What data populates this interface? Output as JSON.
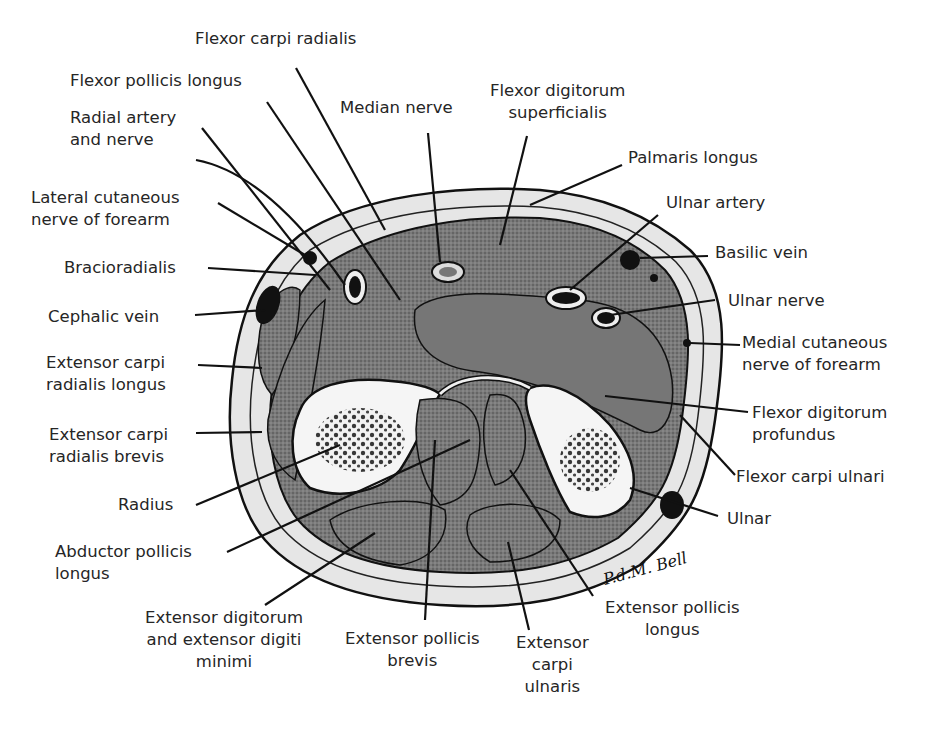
{
  "figure": {
    "signature": "P.d.M. Bell"
  },
  "labels": [
    {
      "id": "flexor-carpi-radialis",
      "text": "Flexor carpi radialis"
    },
    {
      "id": "flexor-pollicis-longus",
      "text": "Flexor pollicis longus"
    },
    {
      "id": "radial-artery-and-nerve",
      "text": "Radial artery\nand nerve"
    },
    {
      "id": "median-nerve",
      "text": "Median nerve"
    },
    {
      "id": "flexor-digitorum-superficialis",
      "text": "Flexor digitorum\nsuperficialis"
    },
    {
      "id": "palmaris-longus",
      "text": "Palmaris longus"
    },
    {
      "id": "ulnar-artery",
      "text": "Ulnar artery"
    },
    {
      "id": "basilic-vein",
      "text": "Basilic vein"
    },
    {
      "id": "ulnar-nerve",
      "text": "Ulnar nerve"
    },
    {
      "id": "medial-cutaneous-nerve",
      "text": "Medial cutaneous\nnerve of forearm"
    },
    {
      "id": "flexor-digitorum-profundus",
      "text": "Flexor digitorum\nprofundus"
    },
    {
      "id": "flexor-carpi-ulnari",
      "text": "Flexor carpi ulnari"
    },
    {
      "id": "ulnar",
      "text": "Ulnar"
    },
    {
      "id": "lateral-cutaneous-nerve",
      "text": "Lateral cutaneous\nnerve of forearm"
    },
    {
      "id": "bracioradialis",
      "text": "Bracioradialis"
    },
    {
      "id": "cephalic-vein",
      "text": "Cephalic vein"
    },
    {
      "id": "extensor-carpi-radialis-longus",
      "text": "Extensor carpi\nradialis longus"
    },
    {
      "id": "extensor-carpi-radialis-brevis",
      "text": "Extensor carpi\nradialis brevis"
    },
    {
      "id": "radius",
      "text": "Radius"
    },
    {
      "id": "abductor-pollicis-longus",
      "text": "Abductor pollicis\nlongus"
    },
    {
      "id": "extensor-digitorum",
      "text": "Extensor digitorum\nand extensor digiti\nminimi"
    },
    {
      "id": "extensor-pollicis-brevis",
      "text": "Extensor pollicis\nbrevis"
    },
    {
      "id": "extensor-carpi-ulnaris",
      "text": "Extensor\ncarpi\nulnaris"
    },
    {
      "id": "extensor-pollicis-longus",
      "text": "Extensor pollicis\nlongus"
    }
  ],
  "colors": {
    "background": "#ffffff",
    "ink": "#1a1a1a",
    "muscle": "#6e6e6e",
    "subcutaneous": "#e4e4e4",
    "bone_cortex": "#f4f4f4",
    "bone_marrow": "#2a2a2a"
  }
}
